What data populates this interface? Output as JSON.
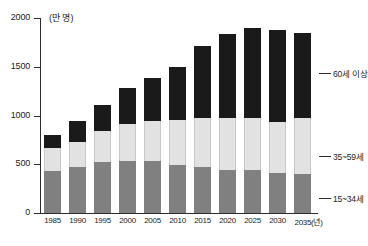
{
  "chart_data": {
    "type": "bar",
    "subtype": "stacked-vertical",
    "title": "",
    "subtitle": "",
    "xlabel": "2035(년)",
    "ylabel": "(만 명)",
    "unit_label": "(만 명)",
    "categories": [
      "1985",
      "1990",
      "1995",
      "2000",
      "2005",
      "2010",
      "2015",
      "2020",
      "2025",
      "2030",
      "2035(년)"
    ],
    "x_tick_labels": [
      "1985",
      "1990",
      "1995",
      "2000",
      "2005",
      "2010",
      "2015",
      "2020",
      "2025",
      "2030",
      "2035(년)"
    ],
    "y_tick_labels": [
      "0",
      "500",
      "1000",
      "1500",
      "2000"
    ],
    "y_ticks": [
      0,
      500,
      1000,
      1500,
      2000
    ],
    "ylim": [
      0,
      2000
    ],
    "grid": false,
    "legend_position": "right-callout",
    "series": [
      {
        "name": "15~34세",
        "color": "#808080",
        "values": [
          430,
          470,
          520,
          535,
          530,
          490,
          475,
          445,
          440,
          410,
          400
        ]
      },
      {
        "name": "35~59세",
        "color": "#e2e2e2",
        "values": [
          235,
          260,
          325,
          375,
          415,
          460,
          500,
          530,
          530,
          520,
          570
        ]
      },
      {
        "name": "60세 이상",
        "color": "#1a1a1a",
        "values": [
          135,
          215,
          265,
          370,
          440,
          545,
          735,
          865,
          930,
          950,
          880
        ]
      }
    ],
    "totals": [
      800,
      945,
      1110,
      1280,
      1385,
      1495,
      1710,
      1840,
      1900,
      1880,
      1850
    ],
    "annotations": [
      {
        "label": "60세 이상",
        "target_series": "60세 이상"
      },
      {
        "label": "35~59세",
        "target_series": "35~59세"
      },
      {
        "label": "15~34세",
        "target_series": "15~34세"
      }
    ]
  },
  "callouts": {
    "old": "60세 이상",
    "mid": "35~59세",
    "young": "15~34세"
  },
  "colors": {
    "old": "#1a1a1a",
    "mid": "#e2e2e2",
    "young": "#808080",
    "axis": "#2b2b2b",
    "text": "#1b1b1b",
    "background": "#ffffff"
  }
}
